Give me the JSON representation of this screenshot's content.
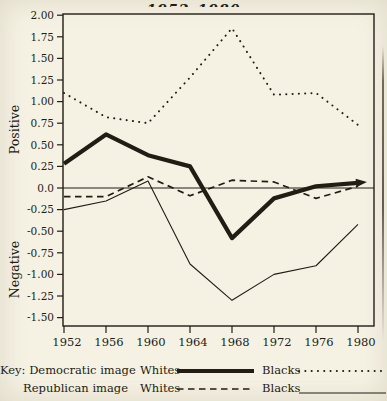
{
  "figure": {
    "title_visible": "1952–1980",
    "axis": {
      "positive_label": "Positive",
      "negative_label": "Negative",
      "y_ticks": [
        "2.00",
        "1.75",
        "1.50",
        "1.25",
        "1.00",
        "0.75",
        "0.50",
        "0.25",
        "0.0",
        "-0.25",
        "-0.50",
        "-0.75",
        "-1.00",
        "-1.25",
        "-1.50"
      ],
      "x_ticks": [
        "1952",
        "1956",
        "1960",
        "1964",
        "1968",
        "1972",
        "1976",
        "1980"
      ]
    }
  },
  "chart_data": {
    "type": "line",
    "title": "1952–1980",
    "x": [
      1952,
      1956,
      1960,
      1964,
      1968,
      1972,
      1976,
      1980
    ],
    "xlabel": "",
    "ylabel_positive": "Positive",
    "ylabel_negative": "Negative",
    "ylim": [
      -1.5,
      2.0
    ],
    "ytick_step": 0.25,
    "grid": false,
    "zero_line": true,
    "series": [
      {
        "name": "Democratic image - Blacks",
        "style": "dotted",
        "values": [
          1.1,
          0.82,
          0.75,
          1.28,
          1.85,
          1.08,
          1.1,
          0.73
        ]
      },
      {
        "name": "Republican image - Blacks",
        "style": "thin-solid",
        "values": [
          -0.25,
          -0.15,
          0.08,
          -0.88,
          -1.3,
          -1.0,
          -0.9,
          -0.42
        ]
      },
      {
        "name": "Republican image - Whites",
        "style": "dashed",
        "values": [
          -0.1,
          -0.1,
          0.13,
          -0.09,
          0.09,
          0.07,
          -0.12,
          0.02
        ]
      },
      {
        "name": "Democratic image - Whites",
        "style": "thick-solid",
        "arrow_end": true,
        "values": [
          0.28,
          0.62,
          0.38,
          0.25,
          -0.58,
          -0.12,
          0.02,
          0.06
        ]
      }
    ]
  },
  "legend": {
    "key_label": "Key:",
    "rows": [
      {
        "group": "Democratic image",
        "entries": [
          {
            "label": "Whites",
            "style": "thick-solid"
          },
          {
            "label": "Blacks",
            "style": "dotted"
          }
        ]
      },
      {
        "group": "Republican image",
        "entries": [
          {
            "label": "Whites",
            "style": "dashed"
          },
          {
            "label": "Blacks",
            "style": "thin-solid"
          }
        ]
      }
    ]
  },
  "colors": {
    "ink": "#211d15",
    "paper": "#f5f2e4"
  }
}
